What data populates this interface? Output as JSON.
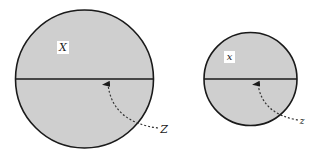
{
  "diagram": {
    "colors": {
      "fill": "#cfcfcf",
      "stroke": "#1a1a1a",
      "background": "#ffffff",
      "label_bg": "#ffffff"
    },
    "circles": [
      {
        "id": "large",
        "cx": 84.5,
        "cy": 79,
        "r": 69,
        "upper_label": "X",
        "pointer_label": "Z",
        "label_pos": {
          "x": 62,
          "y": 51
        },
        "arrow": {
          "start": {
            "x": 158,
            "y": 128
          },
          "ctrl": {
            "x": 112,
            "y": 122
          },
          "end": {
            "x": 108,
            "y": 83
          }
        },
        "pointer_label_pos": {
          "x": 161,
          "y": 132
        }
      },
      {
        "id": "small",
        "cx": 250.5,
        "cy": 79,
        "r": 46.5,
        "upper_label": "x",
        "pointer_label": "z",
        "label_pos": {
          "x": 230,
          "y": 61
        },
        "arrow": {
          "start": {
            "x": 300,
            "y": 120
          },
          "ctrl": {
            "x": 262,
            "y": 114
          },
          "end": {
            "x": 258,
            "y": 83
          }
        },
        "pointer_label_pos": {
          "x": 301,
          "y": 124
        }
      }
    ]
  }
}
